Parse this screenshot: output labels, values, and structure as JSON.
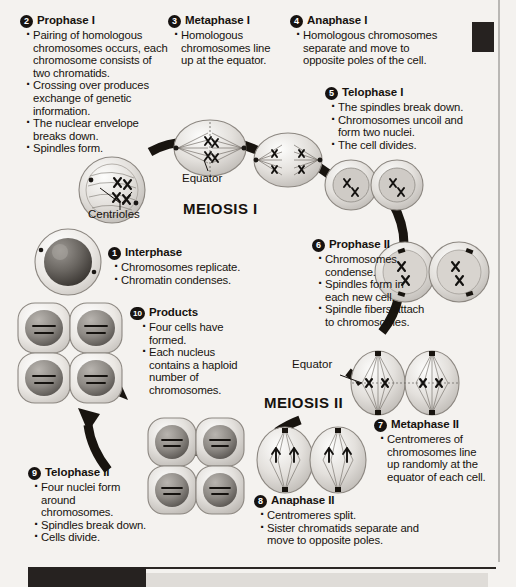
{
  "diagram": {
    "stage_labels": [
      {
        "id": "meiosis-1",
        "text": "MEIOSIS I"
      },
      {
        "id": "meiosis-2",
        "text": "MEIOSIS II"
      }
    ],
    "callouts": [
      {
        "id": "equator-1",
        "text": "Equator"
      },
      {
        "id": "centrioles",
        "text": "Centrioles"
      },
      {
        "id": "equator-2",
        "text": "Equator"
      }
    ],
    "steps": [
      {
        "number": "1",
        "title": "Interphase",
        "bullets": [
          "Chromosomes replicate.",
          "Chromatin condenses."
        ]
      },
      {
        "number": "2",
        "title": "Prophase I",
        "bullets": [
          "Pairing of homologous chromosomes occurs, each chromosome consists of two chromatids.",
          "Crossing over produces exchange of genetic information.",
          "The nuclear envelope breaks down.",
          "Spindles form."
        ]
      },
      {
        "number": "3",
        "title": "Metaphase I",
        "bullets": [
          "Homologous chromosomes line up at the equator."
        ]
      },
      {
        "number": "4",
        "title": "Anaphase I",
        "bullets": [
          "Homologous chromosomes separate and move to opposite poles of the cell."
        ]
      },
      {
        "number": "5",
        "title": "Telophase I",
        "bullets": [
          "The spindles break down.",
          "Chromosomes uncoil and form two nuclei.",
          "The cell divides."
        ]
      },
      {
        "number": "6",
        "title": "Prophase II",
        "bullets": [
          "Chromosomes condense.",
          "Spindles form in each new cell.",
          "Spindle fibers attach to chromosomes."
        ]
      },
      {
        "number": "7",
        "title": "Metaphase II",
        "bullets": [
          "Centromeres of chromosomes line up randomly at the equator of each cell."
        ]
      },
      {
        "number": "8",
        "title": "Anaphase II",
        "bullets": [
          "Centromeres split.",
          "Sister chromatids separate and move to opposite poles."
        ]
      },
      {
        "number": "9",
        "title": "Telophase II",
        "bullets": [
          "Four nuclei form around chromosomes.",
          "Spindles break down.",
          "Cells divide."
        ]
      },
      {
        "number": "10",
        "title": "Products",
        "bullets": [
          "Four cells have formed.",
          "Each nucleus contains a haploid number of chromosomes."
        ]
      }
    ]
  }
}
